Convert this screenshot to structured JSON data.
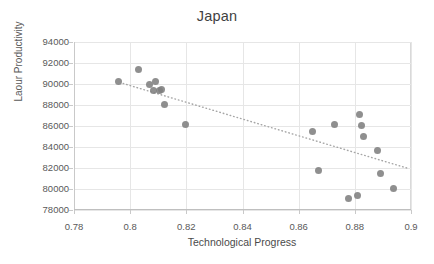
{
  "chart_data": {
    "type": "scatter",
    "title": "Japan",
    "xlabel": "Technological Progress",
    "ylabel": "Laour Productivity",
    "xlim": [
      0.78,
      0.9
    ],
    "ylim": [
      78000,
      94000
    ],
    "xticks": [
      "0.78",
      "0.8",
      "0.82",
      "0.84",
      "0.86",
      "0.88",
      "0.9"
    ],
    "xtick_values": [
      0.78,
      0.8,
      0.82,
      0.84,
      0.86,
      0.88,
      0.9
    ],
    "yticks": [
      "78000",
      "80000",
      "82000",
      "84000",
      "86000",
      "88000",
      "90000",
      "92000",
      "94000"
    ],
    "ytick_values": [
      78000,
      80000,
      82000,
      84000,
      86000,
      88000,
      90000,
      92000,
      94000
    ],
    "grid": true,
    "legend": false,
    "marker_color": "#808080",
    "trendline_color": "#a6a6a6",
    "trendline_style": "dotted",
    "series": [
      {
        "name": "Japan",
        "x": [
          0.796,
          0.8028,
          0.8068,
          0.8084,
          0.809,
          0.8104,
          0.8112,
          0.8122,
          0.8196,
          0.8648,
          0.8672,
          0.8728,
          0.8776,
          0.8808,
          0.8816,
          0.8824,
          0.8832,
          0.888,
          0.8892,
          0.8938
        ],
        "y": [
          90200,
          91400,
          90000,
          89350,
          90250,
          89350,
          89450,
          88050,
          86150,
          85450,
          81750,
          86150,
          79100,
          79400,
          87100,
          86050,
          85000,
          83650,
          81450,
          80050
        ]
      }
    ],
    "trendline": {
      "x0": 0.7975,
      "y0": 90050,
      "x1": 0.8985,
      "y1": 82000
    }
  }
}
